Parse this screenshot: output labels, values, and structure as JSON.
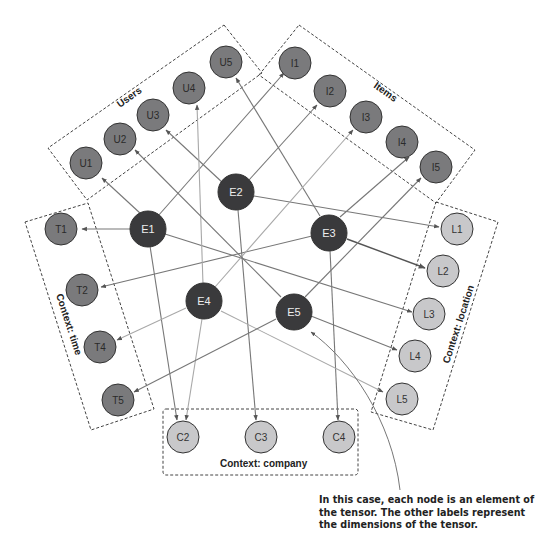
{
  "colors": {
    "element_node": "#3a3a3c",
    "dimension_node_dark": "#7a7a7c",
    "dimension_node_light": "#c8c8ca",
    "edge": "#777777",
    "box_stroke": "#444444"
  },
  "groups": {
    "users": {
      "label": "Users"
    },
    "items": {
      "label": "Items"
    },
    "time": {
      "label": "Context: time"
    },
    "location": {
      "label": "Context: location"
    },
    "company": {
      "label": "Context: company"
    }
  },
  "nodes": {
    "E1": {
      "label": "E1"
    },
    "E2": {
      "label": "E2"
    },
    "E3": {
      "label": "E3"
    },
    "E4": {
      "label": "E4"
    },
    "E5": {
      "label": "E5"
    },
    "U1": {
      "label": "U1"
    },
    "U2": {
      "label": "U2"
    },
    "U3": {
      "label": "U3"
    },
    "U4": {
      "label": "U4"
    },
    "U5": {
      "label": "U5"
    },
    "I1": {
      "label": "I1"
    },
    "I2": {
      "label": "I2"
    },
    "I3": {
      "label": "I3"
    },
    "I4": {
      "label": "I4"
    },
    "I5": {
      "label": "I5"
    },
    "T1": {
      "label": "T1"
    },
    "T2": {
      "label": "T2"
    },
    "T4": {
      "label": "T4"
    },
    "T5": {
      "label": "T5"
    },
    "L1": {
      "label": "L1"
    },
    "L2": {
      "label": "L2"
    },
    "L3": {
      "label": "L3"
    },
    "L4": {
      "label": "L4"
    },
    "L5": {
      "label": "L5"
    },
    "C2": {
      "label": "C2"
    },
    "C3": {
      "label": "C3"
    },
    "C4": {
      "label": "C4"
    }
  },
  "edges": [
    {
      "from": "E1",
      "to": "U1"
    },
    {
      "from": "E1",
      "to": "I1"
    },
    {
      "from": "E1",
      "to": "T1"
    },
    {
      "from": "E1",
      "to": "C2"
    },
    {
      "from": "E1",
      "to": "L3"
    },
    {
      "from": "E2",
      "to": "U3"
    },
    {
      "from": "E2",
      "to": "I2"
    },
    {
      "from": "E2",
      "to": "L1"
    },
    {
      "from": "E2",
      "to": "C3"
    },
    {
      "from": "E3",
      "to": "U5"
    },
    {
      "from": "E3",
      "to": "I4"
    },
    {
      "from": "E3",
      "to": "T2"
    },
    {
      "from": "E3",
      "to": "L2"
    },
    {
      "from": "E3",
      "to": "C4"
    },
    {
      "from": "E4",
      "to": "U4"
    },
    {
      "from": "E4",
      "to": "I3"
    },
    {
      "from": "E4",
      "to": "T4"
    },
    {
      "from": "E4",
      "to": "L5"
    },
    {
      "from": "E4",
      "to": "C2"
    },
    {
      "from": "E5",
      "to": "U2"
    },
    {
      "from": "E5",
      "to": "I5"
    },
    {
      "from": "E5",
      "to": "T5"
    },
    {
      "from": "E5",
      "to": "L4"
    }
  ],
  "annotation": {
    "text": "In this case, each node is an element of the tensor. The other labels represent the dimensions of the tensor.",
    "points_to": "E5"
  }
}
